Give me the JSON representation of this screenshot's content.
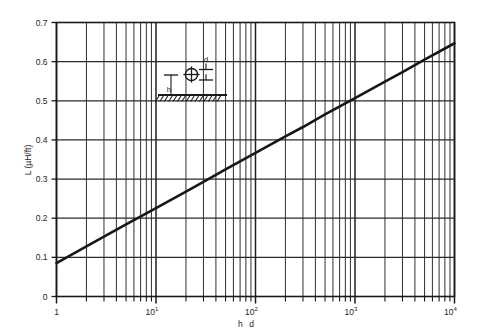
{
  "chart_data": {
    "type": "line",
    "title": "",
    "xlabel": "h d",
    "ylabel": "L  (µH/ft)",
    "xscale": "log",
    "yscale": "linear",
    "xlim": [
      1,
      10000
    ],
    "ylim": [
      0,
      0.7
    ],
    "grid": true,
    "legend": "none",
    "x_tick_labels": [
      "1",
      "10",
      "10",
      "10",
      "10"
    ],
    "x_tick_exponents": [
      "",
      "1",
      "2",
      "3",
      "4"
    ],
    "x_tick_values": [
      1,
      10,
      100,
      1000,
      10000
    ],
    "y_tick_labels": [
      "0",
      "0.1",
      "0.2",
      "0.3",
      "0.4",
      "0.5",
      "0.6",
      "0.7"
    ],
    "y_tick_values": [
      0,
      0.1,
      0.2,
      0.3,
      0.4,
      0.5,
      0.6,
      0.7
    ],
    "series": [
      {
        "name": "L vs h/d",
        "x": [
          1,
          2,
          3,
          5,
          10,
          20,
          30,
          50,
          100,
          200,
          300,
          500,
          1000,
          2000,
          3000,
          5000,
          10000
        ],
        "values": [
          0.085,
          0.128,
          0.153,
          0.184,
          0.226,
          0.268,
          0.293,
          0.325,
          0.367,
          0.409,
          0.433,
          0.465,
          0.507,
          0.549,
          0.573,
          0.605,
          0.647
        ]
      }
    ],
    "annotations": {
      "inset": {
        "conductor_label": "d",
        "height_label": "h",
        "ground_description": "hatched-ground-plane"
      }
    }
  },
  "inset": {
    "d_label": "d",
    "h_label": "h"
  },
  "axes": {
    "y_title": "L  (µH/ft)",
    "x_title_part1": "h",
    "x_title_part2": "d"
  }
}
